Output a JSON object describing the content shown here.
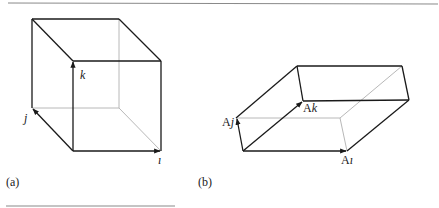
{
  "figure": {
    "panels": [
      {
        "id": "a",
        "caption": "(a)",
        "shape": "unit cube",
        "vectors": [
          {
            "name": "i",
            "label": "ı"
          },
          {
            "name": "j",
            "label": "j"
          },
          {
            "name": "k",
            "label": "k"
          }
        ]
      },
      {
        "id": "b",
        "caption": "(b)",
        "shape": "parallelepiped (image of cube under A)",
        "vectors": [
          {
            "name": "Ai",
            "label_prefix": "A",
            "label": "ı"
          },
          {
            "name": "Aj",
            "label_prefix": "A",
            "label": "j"
          },
          {
            "name": "Ak",
            "label_prefix": "A",
            "label": "k"
          }
        ]
      }
    ],
    "colors": {
      "edge": "#1a1a1a",
      "hidden_edge": "#b8b8b8",
      "rule": "#8a8a8a"
    }
  }
}
